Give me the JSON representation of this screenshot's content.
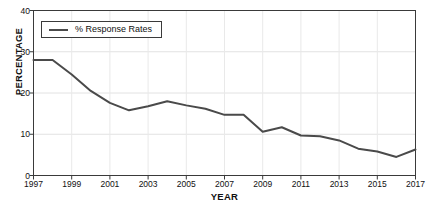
{
  "chart_data": {
    "type": "line",
    "title": "",
    "xlabel": "YEAR",
    "ylabel": "PERCENTAGE",
    "xlim": [
      1997,
      2017
    ],
    "ylim": [
      0,
      40
    ],
    "grid": true,
    "legend_position": "top-left",
    "series_color": "#4a4a4a",
    "x": [
      1997,
      1998,
      1999,
      2000,
      2001,
      2002,
      2003,
      2004,
      2005,
      2006,
      2007,
      2008,
      2009,
      2010,
      2011,
      2012,
      2013,
      2014,
      2015,
      2016,
      2017
    ],
    "series": [
      {
        "name": "% Response Rates",
        "values": [
          28,
          28,
          24.5,
          20.5,
          17.6,
          15.8,
          16.8,
          18,
          17,
          16.2,
          14.7,
          14.7,
          10.6,
          11.7,
          9.7,
          9.5,
          8.5,
          6.5,
          5.8,
          4.5,
          6.3
        ]
      }
    ],
    "y_ticks": [
      0,
      10,
      20,
      30,
      40
    ],
    "y_tick_labels": [
      "0",
      "10",
      "20",
      "30",
      "40"
    ],
    "x_ticks": [
      1997,
      1999,
      2001,
      2003,
      2005,
      2007,
      2009,
      2011,
      2013,
      2015,
      2017
    ],
    "x_tick_labels": [
      "1997",
      "1999",
      "2001",
      "2003",
      "2005",
      "2007",
      "2009",
      "2011",
      "2013",
      "2015",
      "2017"
    ]
  },
  "legend": {
    "label": "% Response Rates"
  }
}
